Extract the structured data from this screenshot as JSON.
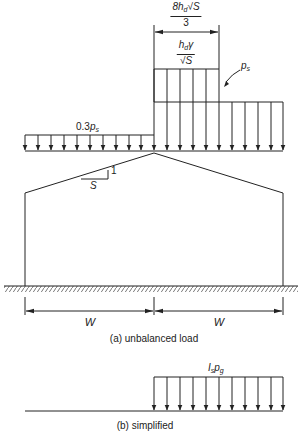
{
  "figure": {
    "part_a": {
      "caption": "(a) unbalanced load",
      "labels": {
        "drift_width_num": "8h",
        "drift_width_num_sub": "d",
        "drift_width_num_tail": "√S",
        "drift_width_den": "3",
        "drift_load_num": "h",
        "drift_load_num_sub": "d",
        "drift_load_num_tail": "γ",
        "drift_load_den": "√S",
        "snow_load": "p",
        "snow_load_sub": "s",
        "leeward_load_prefix": "0.3",
        "leeward_load": "p",
        "leeward_load_sub": "s",
        "slope_run": "S",
        "slope_rise": "1",
        "span_left": "W",
        "span_right": "W"
      }
    },
    "part_b": {
      "caption": "(b) simplified",
      "labels": {
        "load": "I",
        "load_sub1": "s",
        "load_mid": "p",
        "load_sub2": "g"
      }
    },
    "colors": {
      "line": "#222222",
      "background": "#ffffff"
    }
  }
}
